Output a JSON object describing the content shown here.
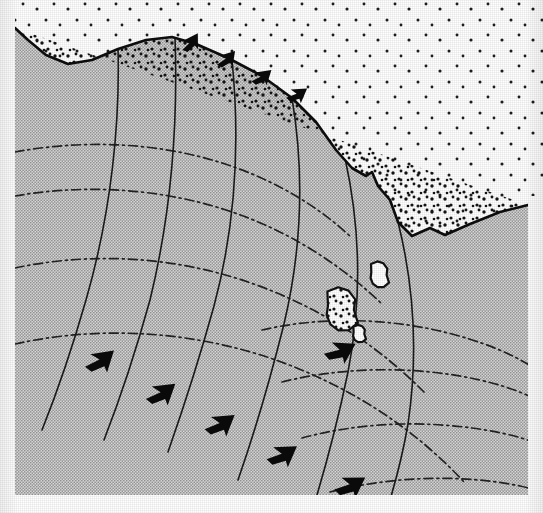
{
  "figure": {
    "kind": "coastal wave refraction map",
    "caption": ""
  },
  "colors": {
    "water_fill": "#c9c9c9",
    "land_fill": "#ffffff",
    "ink": "#111111",
    "page": "#ffffff",
    "coast_line": "#0d0d0d",
    "ray_line": "#1a1a1a",
    "crest_line": "#222222",
    "arrow_fill": "#0a0a0a",
    "stipple_dot": "#1a1a1a"
  },
  "legend_semantics": {
    "water_label": "water (shaded)",
    "land_label": "land (white, stippled)",
    "orthogonal_label": "wave orthogonal / ray (solid line)",
    "crest_label": "wave crest (dash-dot line)",
    "arrow_label": "direction of wave advance (solid arrowhead)",
    "island_label": "offshore island"
  },
  "geometry": {
    "water_polygon": "M 15,28 L 15,495 L 528,495 L 528,205 L 500,212 L 470,224 L 445,235 L 430,228 L 412,236 L 398,222 L 390,200 L 378,186 L 372,172 L 366,176 L 352,168 L 336,150 L 316,122 L 292,98 L 262,76 L 228,58 L 196,44 L 172,37 L 146,40 L 118,49 L 92,60 L 68,64 L 46,55 L 28,40 Z",
    "coast_path": "M 15,28 L 28,40 L 46,55 L 68,64 L 92,60 L 118,49 L 146,40 L 172,37 L 196,44 L 228,58 L 262,76 L 292,98 L 316,122 L 336,150 L 352,168 L 366,176 L 372,172 L 378,186 L 390,200 L 398,222 L 412,236 L 430,228 L 445,235 L 470,224 L 500,212 L 528,205",
    "rays": [
      "M 118,48 C 120,120 112,210 86,300 C 70,356 54,400 42,430",
      "M 175,37 C 178,120 172,210 150,300 C 134,358 118,404 104,440",
      "M 232,60 C 240,140 236,224 214,306 C 198,364 182,412 168,452",
      "M 292,98 C 304,170 302,248 284,324 C 268,388 252,440 238,480",
      "M 345,158 C 360,226 362,300 348,372 C 336,430 324,472 314,505",
      "M 398,222 C 414,286 418,356 408,424 C 400,470 392,492 388,507"
    ],
    "crests": [
      "M 15,152 C 80,140 150,142 212,160 C 268,176 316,204 352,238",
      "M 15,196 C 84,184 158,188 226,210 C 288,230 340,264 382,304",
      "M 15,268 C 90,252 172,256 248,282 C 318,306 376,344 424,392",
      "M 15,344 C 96,326 186,330 270,358 C 346,384 412,426 464,482",
      "M 262,330 C 322,316 392,318 452,334 C 500,347 522,360 540,372",
      "M 282,382 C 346,366 418,366 480,380 C 518,389 534,398 543,404",
      "M 302,438 C 368,420 442,420 506,434 C 528,439 538,444 543,447",
      "M 330,492 C 392,476 462,474 520,486 C 534,489 540,492 543,494"
    ],
    "arrows_coast": [
      {
        "x": 178,
        "y": 48,
        "angle": -58,
        "scale": 1.0
      },
      {
        "x": 213,
        "y": 62,
        "angle": -48,
        "scale": 1.0
      },
      {
        "x": 248,
        "y": 78,
        "angle": -40,
        "scale": 1.0
      },
      {
        "x": 283,
        "y": 94,
        "angle": -34,
        "scale": 1.0
      }
    ],
    "arrows_offshore": [
      {
        "x": 80,
        "y": 362,
        "angle": -40,
        "scale": 1.45
      },
      {
        "x": 141,
        "y": 394,
        "angle": -38,
        "scale": 1.45
      },
      {
        "x": 200,
        "y": 424,
        "angle": -36,
        "scale": 1.45
      },
      {
        "x": 262,
        "y": 454,
        "angle": -34,
        "scale": 1.45
      },
      {
        "x": 330,
        "y": 484,
        "angle": -32,
        "scale": 1.45
      }
    ],
    "arrows_island": [
      {
        "x": 320,
        "y": 348,
        "angle": -28,
        "scale": 1.45
      }
    ],
    "islands": [
      {
        "cx": 379,
        "cy": 275,
        "rx": 10,
        "ry": 12,
        "fill": "#ffffff",
        "stipple": false
      },
      {
        "cx": 341,
        "cy": 310,
        "rx": 17,
        "ry": 20,
        "fill": "#ffffff",
        "stipple": true
      },
      {
        "cx": 359,
        "cy": 334,
        "rx": 7,
        "ry": 8,
        "fill": "#ffffff",
        "stipple": false
      }
    ]
  },
  "stipple": {
    "coast_band_density": "dense",
    "interior_density": "sparse",
    "interior_spacing_px": 30,
    "dot_radius_px": 1.6
  }
}
